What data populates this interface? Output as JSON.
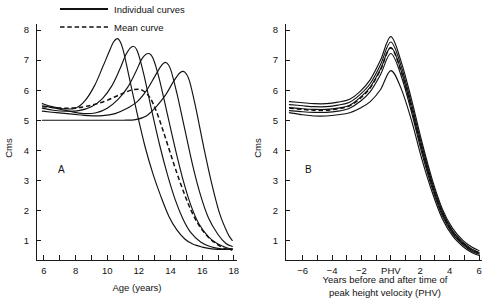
{
  "figure": {
    "background": "#ffffff",
    "ink_color": "#121212"
  },
  "legend": {
    "position": "top-left",
    "items": [
      {
        "label": "Individual curves",
        "style": "solid",
        "name": "individual-curves"
      },
      {
        "label": "Mean curve",
        "style": "dashed",
        "name": "mean-curve"
      }
    ]
  },
  "chart_data": [
    {
      "type": "line",
      "panel": "A",
      "title": "",
      "xlabel": "Age (years)",
      "ylabel": "Cms",
      "xlim": [
        5.5,
        18.2
      ],
      "ylim": [
        0.35,
        8.2
      ],
      "grid": false,
      "legend_position": "top-left",
      "xticks": [
        6,
        7,
        8,
        9,
        10,
        11,
        12,
        13,
        14,
        15,
        16,
        17,
        18
      ],
      "xticklabels": [
        "6",
        "",
        "8",
        "",
        "10",
        "",
        "12",
        "",
        "14",
        "",
        "16",
        "",
        "18"
      ],
      "yticks": [
        1,
        2,
        3,
        4,
        5,
        6,
        7,
        8
      ],
      "yticklabels": [
        "1",
        "2",
        "3",
        "4",
        "5",
        "6",
        "7",
        "8"
      ],
      "series": [
        {
          "name": "Individual curve 1 (earliest maturer)",
          "style": "solid",
          "x": [
            5.9,
            6.5,
            7.2,
            8.0,
            8.6,
            9.2,
            9.7,
            10.1,
            10.4,
            10.7,
            11.0,
            11.4,
            11.9,
            12.4,
            12.9,
            13.4,
            13.9,
            14.4,
            14.9,
            15.4,
            16.0,
            16.6,
            17.3,
            17.9
          ],
          "y": [
            5.55,
            5.45,
            5.38,
            5.4,
            5.65,
            6.15,
            6.75,
            7.25,
            7.6,
            7.7,
            7.35,
            6.4,
            5.2,
            4.1,
            3.2,
            2.45,
            1.8,
            1.35,
            1.05,
            0.88,
            0.78,
            0.72,
            0.7,
            0.72
          ]
        },
        {
          "name": "Individual curve 2",
          "style": "solid",
          "x": [
            5.9,
            6.6,
            7.4,
            8.2,
            9.0,
            9.7,
            10.3,
            10.8,
            11.2,
            11.6,
            11.9,
            12.3,
            12.8,
            13.3,
            13.8,
            14.3,
            14.8,
            15.3,
            15.9,
            16.5,
            17.2,
            17.9
          ],
          "y": [
            5.4,
            5.33,
            5.3,
            5.32,
            5.45,
            5.72,
            6.15,
            6.7,
            7.2,
            7.45,
            7.3,
            6.55,
            5.35,
            4.2,
            3.2,
            2.35,
            1.7,
            1.25,
            0.95,
            0.8,
            0.72,
            0.7
          ]
        },
        {
          "name": "Individual curve 3",
          "style": "solid",
          "x": [
            5.9,
            6.7,
            7.6,
            8.5,
            9.3,
            10.0,
            10.7,
            11.3,
            11.8,
            12.2,
            12.6,
            12.9,
            13.3,
            13.8,
            14.3,
            14.8,
            15.3,
            15.8,
            16.4,
            17.0,
            17.6,
            17.9
          ],
          "y": [
            5.48,
            5.4,
            5.3,
            5.22,
            5.25,
            5.4,
            5.7,
            6.1,
            6.6,
            7.05,
            7.22,
            7.05,
            6.35,
            5.2,
            4.05,
            3.0,
            2.15,
            1.55,
            1.12,
            0.88,
            0.75,
            0.72
          ]
        },
        {
          "name": "Individual curve 4",
          "style": "solid",
          "x": [
            5.9,
            6.8,
            7.8,
            8.8,
            9.7,
            10.5,
            11.2,
            11.9,
            12.5,
            13.0,
            13.4,
            13.7,
            14.0,
            14.4,
            14.9,
            15.4,
            15.9,
            16.4,
            17.0,
            17.5,
            17.9
          ],
          "y": [
            5.3,
            5.25,
            5.2,
            5.15,
            5.15,
            5.22,
            5.38,
            5.62,
            6.0,
            6.45,
            6.8,
            6.92,
            6.7,
            5.9,
            4.7,
            3.5,
            2.5,
            1.75,
            1.2,
            0.9,
            0.8
          ]
        },
        {
          "name": "Individual curve 5 (latest maturer)",
          "style": "solid",
          "x": [
            5.9,
            6.9,
            8.0,
            9.0,
            10.0,
            11.0,
            11.8,
            12.5,
            13.1,
            13.7,
            14.2,
            14.6,
            14.9,
            15.2,
            15.6,
            16.1,
            16.6,
            17.1,
            17.6,
            17.9
          ],
          "y": [
            5.0,
            5.0,
            5.0,
            5.0,
            5.0,
            5.0,
            5.02,
            5.15,
            5.45,
            5.85,
            6.3,
            6.58,
            6.6,
            6.3,
            5.4,
            4.1,
            2.9,
            1.9,
            1.25,
            1.0
          ]
        },
        {
          "name": "Mean curve",
          "style": "dashed",
          "x": [
            5.9,
            6.6,
            7.4,
            8.2,
            9.0,
            9.8,
            10.5,
            11.1,
            11.7,
            12.2,
            12.7,
            13.1,
            13.5,
            13.9,
            14.3,
            14.8,
            15.3,
            15.8,
            16.4,
            17.0,
            17.5,
            17.9
          ],
          "y": [
            5.45,
            5.42,
            5.4,
            5.42,
            5.5,
            5.62,
            5.78,
            5.92,
            6.02,
            6.0,
            5.75,
            5.3,
            4.7,
            4.05,
            3.4,
            2.65,
            2.0,
            1.5,
            1.1,
            0.85,
            0.72,
            0.68
          ]
        }
      ]
    },
    {
      "type": "line",
      "panel": "B",
      "title": "",
      "xlabel": "Years before and after time of peak height velocity (PHV)",
      "xlabel_line1": "Years before and after time of",
      "xlabel_line2": "peak height velocity (PHV)",
      "ylabel": "Cms",
      "xlim": [
        -7.2,
        6.2
      ],
      "ylim": [
        0.35,
        8.2
      ],
      "grid": false,
      "legend_position": "none",
      "xticks": [
        -6,
        -5,
        -4,
        -3,
        -2,
        -1,
        0,
        1,
        2,
        3,
        4,
        5,
        6
      ],
      "xticklabels": [
        "-6",
        "",
        "-4",
        "",
        "-2",
        "",
        "PHV",
        "",
        "2",
        "",
        "4",
        "",
        "6"
      ],
      "yticks": [
        1,
        2,
        3,
        4,
        5,
        6,
        7,
        8
      ],
      "yticklabels": [
        "1",
        "2",
        "3",
        "4",
        "5",
        "6",
        "7",
        "8"
      ],
      "series": [
        {
          "name": "Individual curve 1",
          "style": "solid",
          "x": [
            -6.9,
            -6.0,
            -5.2,
            -4.4,
            -3.6,
            -2.8,
            -2.1,
            -1.4,
            -0.7,
            0.0,
            0.7,
            1.4,
            2.1,
            2.8,
            3.5,
            4.2,
            4.9,
            5.5,
            6.0
          ],
          "y": [
            5.62,
            5.58,
            5.55,
            5.55,
            5.6,
            5.7,
            5.95,
            6.35,
            7.0,
            7.78,
            6.95,
            5.7,
            4.3,
            3.05,
            2.05,
            1.4,
            1.0,
            0.78,
            0.66
          ]
        },
        {
          "name": "Individual curve 2",
          "style": "solid",
          "x": [
            -6.9,
            -6.0,
            -5.2,
            -4.4,
            -3.6,
            -2.8,
            -2.1,
            -1.4,
            -0.7,
            0.0,
            0.7,
            1.4,
            2.1,
            2.8,
            3.5,
            4.2,
            4.9,
            5.5,
            6.0
          ],
          "y": [
            5.52,
            5.48,
            5.45,
            5.45,
            5.5,
            5.6,
            5.85,
            6.22,
            6.85,
            7.6,
            6.8,
            5.55,
            4.18,
            2.95,
            1.98,
            1.32,
            0.94,
            0.72,
            0.6
          ]
        },
        {
          "name": "Individual curve 3",
          "style": "solid",
          "x": [
            -6.9,
            -6.0,
            -5.2,
            -4.4,
            -3.6,
            -2.8,
            -2.1,
            -1.4,
            -0.7,
            0.0,
            0.7,
            1.4,
            2.1,
            2.8,
            3.5,
            4.2,
            4.9,
            5.5,
            6.0
          ],
          "y": [
            5.42,
            5.38,
            5.36,
            5.36,
            5.4,
            5.5,
            5.75,
            6.1,
            6.7,
            7.42,
            6.65,
            5.42,
            4.05,
            2.85,
            1.9,
            1.28,
            0.9,
            0.68,
            0.57
          ]
        },
        {
          "name": "Individual curve 4",
          "style": "solid",
          "x": [
            -6.9,
            -6.0,
            -5.2,
            -4.4,
            -3.6,
            -2.8,
            -2.1,
            -1.4,
            -0.7,
            0.0,
            0.7,
            1.4,
            2.1,
            2.8,
            3.5,
            4.2,
            4.9,
            5.5,
            6.0
          ],
          "y": [
            5.32,
            5.28,
            5.26,
            5.26,
            5.3,
            5.4,
            5.62,
            5.95,
            6.52,
            7.22,
            6.48,
            5.28,
            3.92,
            2.75,
            1.82,
            1.22,
            0.86,
            0.64,
            0.54
          ]
        },
        {
          "name": "Individual curve 5",
          "style": "solid",
          "x": [
            -6.9,
            -6.0,
            -5.2,
            -4.4,
            -3.6,
            -2.8,
            -2.1,
            -1.4,
            -0.7,
            0.0,
            0.7,
            1.4,
            2.1,
            2.8,
            3.5,
            4.2,
            4.9,
            5.5,
            6.0
          ],
          "y": [
            5.25,
            5.18,
            5.14,
            5.14,
            5.18,
            5.25,
            5.4,
            5.62,
            6.02,
            6.65,
            6.05,
            5.0,
            3.72,
            2.62,
            1.72,
            1.15,
            0.8,
            0.6,
            0.5
          ]
        },
        {
          "name": "Mean curve",
          "style": "dashed",
          "x": [
            -6.9,
            -6.0,
            -5.2,
            -4.4,
            -3.6,
            -2.8,
            -2.1,
            -1.4,
            -0.7,
            0.0,
            0.7,
            1.4,
            2.1,
            2.8,
            3.5,
            4.2,
            4.9,
            5.5,
            6.0
          ],
          "y": [
            5.4,
            5.36,
            5.33,
            5.33,
            5.38,
            5.48,
            5.72,
            6.08,
            6.68,
            7.4,
            6.62,
            5.4,
            4.05,
            2.85,
            1.9,
            1.28,
            0.9,
            0.68,
            0.58
          ]
        }
      ]
    }
  ]
}
